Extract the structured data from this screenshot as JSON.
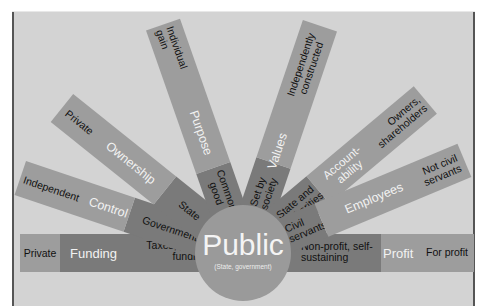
{
  "diagram": {
    "center": {
      "title": "Public",
      "subtitle": "(State, government)"
    },
    "spokes": [
      {
        "category": "Funding",
        "public_value": "Taxes, public funding",
        "private_value": "Private"
      },
      {
        "category": "Control",
        "public_value": "Government",
        "private_value": "Independent"
      },
      {
        "category": "Ownership",
        "public_value": "State",
        "private_value": "Private"
      },
      {
        "category": "Purpose",
        "public_value": "Common good",
        "private_value": "Individual gain"
      },
      {
        "category": "Values",
        "public_value": "Set by society",
        "private_value": "Independently constructed"
      },
      {
        "category": "Account-ability",
        "public_value": "State and authorities",
        "private_value": "Owners, shareholders"
      },
      {
        "category": "Employees",
        "public_value": "Civil servants",
        "private_value": "Not civil servants"
      },
      {
        "category": "Profit",
        "public_value": "Non-profit, self-sustaining",
        "private_value": "For profit"
      }
    ],
    "colors": {
      "background": "#d3d3d3",
      "inner_segment": "#7a7a7a",
      "outer_segment": "#9d9d9d",
      "circle": "#9a9a9a"
    }
  }
}
